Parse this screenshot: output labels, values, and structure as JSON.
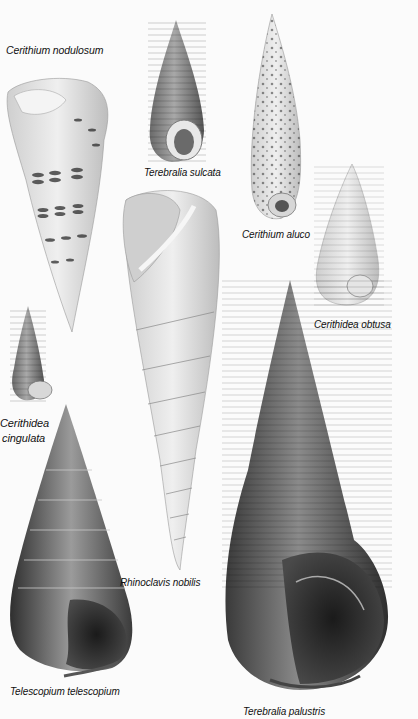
{
  "plate": {
    "background": "#fbfbfb",
    "style": "grayscale natural-history illustration of gastropod shells"
  },
  "shells": [
    {
      "id": "cerithium-nodulosum",
      "label": "Cerithium nodulosum"
    },
    {
      "id": "terebralia-sulcata",
      "label": "Terebralia sulcata"
    },
    {
      "id": "cerithium-aluco",
      "label": "Cerithium aluco"
    },
    {
      "id": "cerithidea-obtusa",
      "label": "Cerithidea obtusa"
    },
    {
      "id": "cerithidea-cingulata",
      "label_line1": "Cerithidea",
      "label_line2": "cingulata"
    },
    {
      "id": "rhinoclavis-nobilis",
      "label": "Rhinoclavis nobilis"
    },
    {
      "id": "telescopium-telescopium",
      "label": "Telescopium telescopium"
    },
    {
      "id": "terebralia-palustris",
      "label": "Terebralia palustris"
    }
  ]
}
